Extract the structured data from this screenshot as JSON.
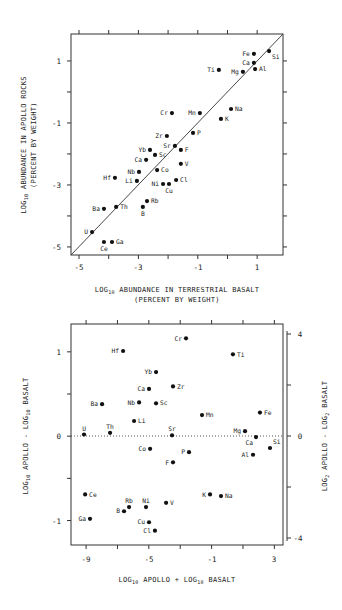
{
  "chart_data": [
    {
      "type": "scatter",
      "title": "",
      "xlabel": "LOG10 ABUNDANCE IN TERRESTRIAL BASALT",
      "xlabel_sub": "(PERCENT BY WEIGHT)",
      "ylabel": "LOG10 ABUNDANCE IN APOLLO ROCKS",
      "ylabel_sub": "(PERCENT BY WEIGHT)",
      "xlim": [
        -5.27,
        1.87
      ],
      "ylim": [
        -5.26,
        1.87
      ],
      "xticks": [
        -5,
        -3,
        -1,
        1
      ],
      "yticks": [
        1,
        -1,
        -3,
        -5
      ],
      "reference_line": "y = x",
      "grid": false,
      "points": [
        {
          "label": "Fe",
          "x": 0.89,
          "y": 1.23,
          "pos": "left"
        },
        {
          "label": "Ca",
          "x": 0.89,
          "y": 0.94,
          "pos": "left"
        },
        {
          "label": "Si",
          "x": 1.4,
          "y": 1.32,
          "pos": "belowright"
        },
        {
          "label": "Al",
          "x": 0.93,
          "y": 0.74,
          "pos": "right"
        },
        {
          "label": "Mg",
          "x": 0.52,
          "y": 0.65,
          "pos": "left"
        },
        {
          "label": "Ti",
          "x": -0.29,
          "y": 0.71,
          "pos": "left"
        },
        {
          "label": "Na",
          "x": 0.12,
          "y": -0.55,
          "pos": "right"
        },
        {
          "label": "K",
          "x": -0.22,
          "y": -0.87,
          "pos": "right"
        },
        {
          "label": "Mn",
          "x": -0.93,
          "y": -0.68,
          "pos": "left"
        },
        {
          "label": "Cr",
          "x": -1.87,
          "y": -0.68,
          "pos": "left"
        },
        {
          "label": "P",
          "x": -1.16,
          "y": -1.32,
          "pos": "right"
        },
        {
          "label": "Zr",
          "x": -2.04,
          "y": -1.42,
          "pos": "left"
        },
        {
          "label": "Sr",
          "x": -1.77,
          "y": -1.74,
          "pos": "left"
        },
        {
          "label": "F",
          "x": -1.57,
          "y": -1.87,
          "pos": "right"
        },
        {
          "label": "Yb",
          "x": -2.61,
          "y": -1.87,
          "pos": "left"
        },
        {
          "label": "Sc",
          "x": -2.44,
          "y": -2.03,
          "pos": "right"
        },
        {
          "label": "Ca",
          "x": -2.74,
          "y": -2.19,
          "pos": "left"
        },
        {
          "label": "V",
          "x": -1.57,
          "y": -2.32,
          "pos": "right"
        },
        {
          "label": "Nb",
          "x": -2.98,
          "y": -2.58,
          "pos": "left"
        },
        {
          "label": "Co",
          "x": -2.37,
          "y": -2.52,
          "pos": "right"
        },
        {
          "label": "Hf",
          "x": -3.79,
          "y": -2.77,
          "pos": "left"
        },
        {
          "label": "Li",
          "x": -3.05,
          "y": -2.87,
          "pos": "left"
        },
        {
          "label": "Ni",
          "x": -2.17,
          "y": -2.97,
          "pos": "left"
        },
        {
          "label": "Cu",
          "x": -1.97,
          "y": -2.97,
          "pos": "below"
        },
        {
          "label": "Cl",
          "x": -1.73,
          "y": -2.84,
          "pos": "right"
        },
        {
          "label": "Rb",
          "x": -2.71,
          "y": -3.52,
          "pos": "right"
        },
        {
          "label": "B",
          "x": -2.85,
          "y": -3.71,
          "pos": "below"
        },
        {
          "label": "Ba",
          "x": -4.16,
          "y": -3.77,
          "pos": "left"
        },
        {
          "label": "Th",
          "x": -3.75,
          "y": -3.71,
          "pos": "right"
        },
        {
          "label": "U",
          "x": -4.56,
          "y": -4.52,
          "pos": "left"
        },
        {
          "label": "Ce",
          "x": -4.16,
          "y": -4.84,
          "pos": "below"
        },
        {
          "label": "Ga",
          "x": -3.89,
          "y": -4.84,
          "pos": "right"
        }
      ]
    },
    {
      "type": "scatter",
      "title": "",
      "xlabel": "LOG10 APOLLO + LOG10 BASALT",
      "ylabel": "LOG10 APOLLO - LOG10 BASALT",
      "ylabel_right": "LOG2 APOLLO - LOG2 BASALT",
      "xlim": [
        -9.96,
        3.55
      ],
      "ylim": [
        -1.29,
        1.33
      ],
      "xticks": [
        -9,
        -5,
        -1,
        3
      ],
      "yticks": [
        1,
        0,
        -1
      ],
      "yticks_right": [
        4,
        0,
        -4
      ],
      "reference_line": "y = 0 (dotted)",
      "grid": false,
      "points": [
        {
          "label": "Cr",
          "x": -2.63,
          "y": 1.16,
          "pos": "left"
        },
        {
          "label": "Hf",
          "x": -6.64,
          "y": 1.01,
          "pos": "left"
        },
        {
          "label": "Ti",
          "x": 0.36,
          "y": 0.97,
          "pos": "right"
        },
        {
          "label": "Yb",
          "x": -4.54,
          "y": 0.76,
          "pos": "left"
        },
        {
          "label": "Zr",
          "x": -3.46,
          "y": 0.59,
          "pos": "right"
        },
        {
          "label": "Ca",
          "x": -4.99,
          "y": 0.56,
          "pos": "left"
        },
        {
          "label": "Ba",
          "x": -7.98,
          "y": 0.38,
          "pos": "left"
        },
        {
          "label": "Nb",
          "x": -5.62,
          "y": 0.4,
          "pos": "left"
        },
        {
          "label": "Sc",
          "x": -4.54,
          "y": 0.39,
          "pos": "right"
        },
        {
          "label": "Fe",
          "x": 2.08,
          "y": 0.28,
          "pos": "right"
        },
        {
          "label": "Mn",
          "x": -1.61,
          "y": 0.25,
          "pos": "right"
        },
        {
          "label": "Li",
          "x": -5.94,
          "y": 0.18,
          "pos": "right"
        },
        {
          "label": "U",
          "x": -9.13,
          "y": 0.02,
          "pos": "above"
        },
        {
          "label": "Th",
          "x": -7.47,
          "y": 0.04,
          "pos": "above"
        },
        {
          "label": "Sr",
          "x": -3.52,
          "y": 0.01,
          "pos": "above"
        },
        {
          "label": "Mg",
          "x": 1.13,
          "y": 0.06,
          "pos": "left"
        },
        {
          "label": "Ca",
          "x": 1.83,
          "y": -0.01,
          "pos": "belowleft"
        },
        {
          "label": "Si",
          "x": 2.72,
          "y": -0.14,
          "pos": "aboveright"
        },
        {
          "label": "Co",
          "x": -4.92,
          "y": -0.15,
          "pos": "left"
        },
        {
          "label": "P",
          "x": -2.44,
          "y": -0.19,
          "pos": "left"
        },
        {
          "label": "Al",
          "x": 1.64,
          "y": -0.22,
          "pos": "left"
        },
        {
          "label": "F",
          "x": -3.46,
          "y": -0.31,
          "pos": "left"
        },
        {
          "label": "Ce",
          "x": -9.06,
          "y": -0.69,
          "pos": "right"
        },
        {
          "label": "K",
          "x": -1.1,
          "y": -0.69,
          "pos": "left"
        },
        {
          "label": "Na",
          "x": -0.4,
          "y": -0.71,
          "pos": "right"
        },
        {
          "label": "V",
          "x": -3.9,
          "y": -0.79,
          "pos": "right"
        },
        {
          "label": "Rb",
          "x": -6.26,
          "y": -0.84,
          "pos": "above"
        },
        {
          "label": "Ni",
          "x": -5.18,
          "y": -0.84,
          "pos": "above"
        },
        {
          "label": "B",
          "x": -6.58,
          "y": -0.89,
          "pos": "left"
        },
        {
          "label": "Ga",
          "x": -8.75,
          "y": -0.98,
          "pos": "left"
        },
        {
          "label": "Cu",
          "x": -4.99,
          "y": -1.02,
          "pos": "left"
        },
        {
          "label": "Cl",
          "x": -4.61,
          "y": -1.12,
          "pos": "left"
        }
      ]
    }
  ],
  "top_chart": {
    "x_axis": {
      "label_pre": "LOG",
      "label_sub": "10",
      "label_post": " ABUNDANCE IN TERRESTRIAL BASALT",
      "label_line2": "(PERCENT BY WEIGHT)"
    },
    "y_axis": {
      "label_pre": "LOG",
      "label_sub": "10",
      "label_post": " ABUNDANCE IN APOLLO ROCKS",
      "label_line2": "(PERCENT BY WEIGHT)"
    },
    "x_tick_labels": [
      "-5",
      "-3",
      "-1",
      "1"
    ],
    "y_tick_labels": [
      "1",
      "-1",
      "-3",
      "-5"
    ]
  },
  "bottom_chart": {
    "x_axis": {
      "label_pre": "LOG",
      "label_sub": "10",
      "label_mid": " APOLLO + LOG",
      "label_sub2": "10",
      "label_post": " BASALT"
    },
    "y_axis": {
      "label_pre": "LOG",
      "label_sub": "10",
      "label_mid": " APOLLO - LOG",
      "label_sub2": "10",
      "label_post": " BASALT"
    },
    "y_axis_right": {
      "label_pre": "LOG",
      "label_sub": "2",
      "label_mid": " APOLLO - LOG",
      "label_sub2": "2",
      "label_post": " BASALT"
    },
    "x_tick_labels": [
      "-9",
      "-5",
      "-1",
      "3"
    ],
    "y_tick_labels": [
      "1",
      "0",
      "-1"
    ],
    "y_right_tick_labels": [
      "4",
      "0",
      "-4"
    ]
  }
}
